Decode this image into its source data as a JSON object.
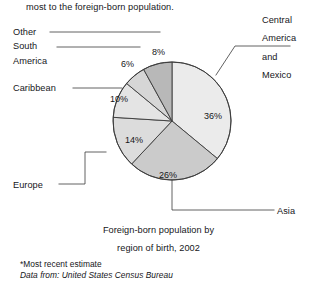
{
  "intro": {
    "text": "most to the foreign-born population."
  },
  "chart_data": {
    "type": "pie",
    "title_line1": "Foreign-born population by",
    "title_line2": "region of birth, 2002",
    "categories": [
      "Central America and Mexico",
      "Asia",
      "Europe",
      "Caribbean",
      "South America",
      "Other"
    ],
    "values": [
      36,
      26,
      14,
      10,
      6,
      8
    ],
    "value_labels": [
      "36%",
      "26%",
      "14%",
      "10%",
      "6%",
      "8%"
    ],
    "unit": "percent",
    "start_angle_deg": 0,
    "direction": "clockwise",
    "legend": "callout-labels",
    "grid": false,
    "slice_colors": [
      "#ebebeb",
      "#cbcbcb",
      "#dcdcdc",
      "#e4e4e4",
      "#d6d6d6",
      "#b8b8b8"
    ],
    "outline_color": "#3a3a3a",
    "slices": [
      {
        "label": "Central America and Mexico",
        "value": 36,
        "value_label": "36%",
        "color": "#ebebeb"
      },
      {
        "label": "Asia",
        "value": 26,
        "value_label": "26%",
        "color": "#cbcbcb"
      },
      {
        "label": "Europe",
        "value": 14,
        "value_label": "14%",
        "color": "#dcdcdc"
      },
      {
        "label": "Caribbean",
        "value": 10,
        "value_label": "10%",
        "color": "#e4e4e4"
      },
      {
        "label": "South America",
        "value": 6,
        "value_label": "6%",
        "color": "#d6d6d6"
      },
      {
        "label": "Other",
        "value": 8,
        "value_label": "8%",
        "color": "#b8b8b8"
      }
    ]
  },
  "labels": {
    "other": "Other",
    "south": "South",
    "america": "America",
    "caribbean": "Caribbean",
    "europe": "Europe",
    "asia": "Asia",
    "central_1": "Central",
    "central_2": "America",
    "central_3": "and",
    "central_4": "Mexico"
  },
  "footnotes": {
    "estimate": "*Most recent estimate",
    "source": "Data from: United States Census Bureau"
  }
}
